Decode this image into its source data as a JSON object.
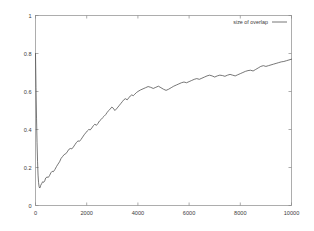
{
  "chart_data": {
    "type": "line",
    "title": "",
    "xlabel": "",
    "ylabel": "",
    "xlim": [
      0,
      10000
    ],
    "ylim": [
      0,
      1
    ],
    "grid": false,
    "legend_position": "top-right",
    "legend": [
      "size of overlap"
    ],
    "xticks": [
      0,
      2000,
      4000,
      6000,
      8000,
      10000
    ],
    "xtick_labels": [
      "0",
      "2000",
      "4000",
      "6000",
      "8000",
      "10000"
    ],
    "yticks": [
      0,
      0.2,
      0.4,
      0.6,
      0.8,
      1
    ],
    "ytick_labels": [
      "0",
      "0.2",
      "0.4",
      "0.6",
      "0.8",
      "1"
    ],
    "line_color": "#4a4a4a",
    "series": [
      {
        "name": "size of overlap",
        "x": [
          0,
          20,
          40,
          60,
          80,
          100,
          120,
          140,
          160,
          180,
          200,
          240,
          280,
          320,
          360,
          400,
          450,
          500,
          550,
          600,
          650,
          700,
          760,
          820,
          880,
          940,
          1000,
          1060,
          1120,
          1180,
          1240,
          1300,
          1360,
          1420,
          1480,
          1540,
          1600,
          1660,
          1720,
          1780,
          1840,
          1900,
          1960,
          2020,
          2080,
          2140,
          2200,
          2260,
          2320,
          2380,
          2440,
          2500,
          2560,
          2620,
          2680,
          2740,
          2800,
          2860,
          2920,
          2980,
          3040,
          3100,
          3160,
          3220,
          3280,
          3340,
          3400,
          3460,
          3520,
          3580,
          3640,
          3700,
          3760,
          3820,
          3880,
          3940,
          4000,
          4100,
          4200,
          4300,
          4400,
          4500,
          4600,
          4700,
          4800,
          4900,
          5000,
          5100,
          5200,
          5300,
          5400,
          5500,
          5600,
          5700,
          5800,
          5900,
          6000,
          6100,
          6200,
          6300,
          6400,
          6500,
          6600,
          6700,
          6800,
          6900,
          7000,
          7100,
          7200,
          7300,
          7400,
          7500,
          7600,
          7700,
          7800,
          7900,
          8000,
          8100,
          8200,
          8300,
          8400,
          8500,
          8600,
          8700,
          8800,
          8900,
          9000,
          9100,
          9200,
          9300,
          9400,
          9500,
          9600,
          9700,
          9800,
          9900,
          10000
        ],
        "values": [
          0.8,
          0.62,
          0.46,
          0.33,
          0.23,
          0.16,
          0.12,
          0.1,
          0.092,
          0.095,
          0.105,
          0.115,
          0.125,
          0.122,
          0.13,
          0.145,
          0.15,
          0.148,
          0.158,
          0.172,
          0.18,
          0.178,
          0.19,
          0.205,
          0.218,
          0.23,
          0.248,
          0.258,
          0.268,
          0.272,
          0.282,
          0.295,
          0.3,
          0.298,
          0.308,
          0.32,
          0.332,
          0.34,
          0.338,
          0.348,
          0.36,
          0.372,
          0.382,
          0.392,
          0.4,
          0.398,
          0.408,
          0.42,
          0.428,
          0.422,
          0.432,
          0.445,
          0.452,
          0.462,
          0.47,
          0.478,
          0.49,
          0.5,
          0.508,
          0.518,
          0.512,
          0.5,
          0.508,
          0.518,
          0.528,
          0.538,
          0.548,
          0.558,
          0.562,
          0.556,
          0.566,
          0.576,
          0.582,
          0.578,
          0.586,
          0.594,
          0.6,
          0.608,
          0.614,
          0.62,
          0.626,
          0.622,
          0.616,
          0.622,
          0.628,
          0.62,
          0.612,
          0.606,
          0.612,
          0.62,
          0.628,
          0.634,
          0.64,
          0.646,
          0.65,
          0.646,
          0.652,
          0.658,
          0.664,
          0.668,
          0.664,
          0.67,
          0.676,
          0.682,
          0.686,
          0.682,
          0.676,
          0.682,
          0.686,
          0.684,
          0.68,
          0.686,
          0.69,
          0.686,
          0.682,
          0.688,
          0.694,
          0.7,
          0.706,
          0.71,
          0.712,
          0.708,
          0.716,
          0.724,
          0.732,
          0.736,
          0.732,
          0.736,
          0.74,
          0.744,
          0.748,
          0.752,
          0.756,
          0.758,
          0.762,
          0.766,
          0.77
        ]
      }
    ]
  }
}
